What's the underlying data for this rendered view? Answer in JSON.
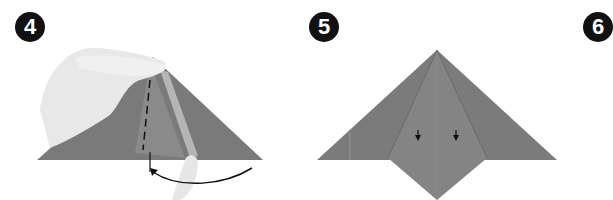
{
  "diagram": {
    "colors": {
      "paper": "#7d7d7d",
      "paper_dark": "#6e6e6e",
      "paper_flap": "#8a8a8a",
      "flap_edge": "#b8b8b8",
      "hand": "#e6e6e6",
      "badge": "#111111",
      "arrow": "#111111"
    },
    "steps": [
      {
        "number": "4",
        "description": "Hand holds paper triangle; fold the left-center flap along the dashed line, arrow shows swing to the left"
      },
      {
        "number": "5",
        "description": "Triangle with center diamond flap; two small down-pointing arrows on the flap"
      },
      {
        "number": "6",
        "description": "Next step badge (cropped at right edge)"
      }
    ]
  }
}
